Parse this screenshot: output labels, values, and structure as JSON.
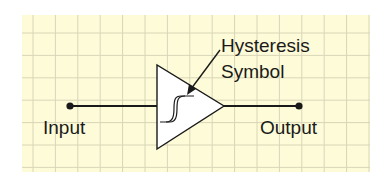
{
  "diagram": {
    "labels": {
      "input": "Input",
      "output": "Output",
      "annotation_line1": "Hysteresis",
      "annotation_line2": "Symbol"
    },
    "colors": {
      "paper": "#fdfbd8",
      "grid": "#d9d6b8",
      "stroke": "#1a1a1a",
      "triangle_fill": "#ffffff"
    },
    "grid": {
      "x0": 22,
      "y0": 15,
      "x1": 370,
      "y1": 172,
      "spacing": 22.4
    },
    "nodes": {
      "input_terminal": {
        "x": 70,
        "y": 106
      },
      "output_terminal": {
        "x": 299,
        "y": 106
      }
    },
    "buffer_triangle": {
      "points": [
        [
          157,
          65
        ],
        [
          157,
          149
        ],
        [
          224,
          106
        ]
      ]
    }
  }
}
